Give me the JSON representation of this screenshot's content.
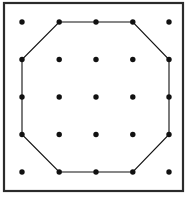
{
  "figure": {
    "name": "geoboard-octagon-figure",
    "canvas": {
      "width": 188,
      "height": 201,
      "background": "#ffffff"
    },
    "frame": {
      "name": "outer-border-rectangle",
      "x": 4,
      "y": 3,
      "width": 179,
      "height": 188,
      "stroke": "#2b2b2b",
      "stroke_width": 2.2,
      "fill": "none"
    },
    "grid": {
      "name": "pin-grid",
      "rows": 5,
      "columns": 5,
      "x_positions": [
        22,
        59.2,
        96,
        132.8,
        169
      ],
      "y_positions": [
        22,
        59.5,
        97,
        134.5,
        172
      ],
      "dot_radius": 2.7,
      "dot_color": "#111111",
      "points": [
        {
          "id": "p-0-0",
          "col": 0,
          "row": 0,
          "x": 22,
          "y": 22
        },
        {
          "id": "p-1-0",
          "col": 1,
          "row": 0,
          "x": 59.2,
          "y": 22
        },
        {
          "id": "p-2-0",
          "col": 2,
          "row": 0,
          "x": 96,
          "y": 22
        },
        {
          "id": "p-3-0",
          "col": 3,
          "row": 0,
          "x": 132.8,
          "y": 22
        },
        {
          "id": "p-4-0",
          "col": 4,
          "row": 0,
          "x": 169,
          "y": 22
        },
        {
          "id": "p-0-1",
          "col": 0,
          "row": 1,
          "x": 22,
          "y": 59.5
        },
        {
          "id": "p-1-1",
          "col": 1,
          "row": 1,
          "x": 59.2,
          "y": 59.5
        },
        {
          "id": "p-2-1",
          "col": 2,
          "row": 1,
          "x": 96,
          "y": 59.5
        },
        {
          "id": "p-3-1",
          "col": 3,
          "row": 1,
          "x": 132.8,
          "y": 59.5
        },
        {
          "id": "p-4-1",
          "col": 4,
          "row": 1,
          "x": 169,
          "y": 59.5
        },
        {
          "id": "p-0-2",
          "col": 0,
          "row": 2,
          "x": 22,
          "y": 97
        },
        {
          "id": "p-1-2",
          "col": 1,
          "row": 2,
          "x": 59.2,
          "y": 97
        },
        {
          "id": "p-2-2",
          "col": 2,
          "row": 2,
          "x": 96,
          "y": 97
        },
        {
          "id": "p-3-2",
          "col": 3,
          "row": 2,
          "x": 132.8,
          "y": 97
        },
        {
          "id": "p-4-2",
          "col": 4,
          "row": 2,
          "x": 169,
          "y": 97
        },
        {
          "id": "p-0-3",
          "col": 0,
          "row": 3,
          "x": 22,
          "y": 134.5
        },
        {
          "id": "p-1-3",
          "col": 1,
          "row": 3,
          "x": 59.2,
          "y": 134.5
        },
        {
          "id": "p-2-3",
          "col": 2,
          "row": 3,
          "x": 96,
          "y": 134.5
        },
        {
          "id": "p-3-3",
          "col": 3,
          "row": 3,
          "x": 132.8,
          "y": 134.5
        },
        {
          "id": "p-4-3",
          "col": 4,
          "row": 3,
          "x": 169,
          "y": 134.5
        },
        {
          "id": "p-0-4",
          "col": 0,
          "row": 4,
          "x": 22,
          "y": 172
        },
        {
          "id": "p-1-4",
          "col": 1,
          "row": 4,
          "x": 59.2,
          "y": 172
        },
        {
          "id": "p-2-4",
          "col": 2,
          "row": 4,
          "x": 96,
          "y": 172
        },
        {
          "id": "p-3-4",
          "col": 3,
          "row": 4,
          "x": 132.8,
          "y": 172
        },
        {
          "id": "p-4-4",
          "col": 4,
          "row": 4,
          "x": 169,
          "y": 172
        }
      ]
    },
    "shape": {
      "name": "octagon-outline",
      "sides": 8,
      "stroke": "#111111",
      "stroke_width": 1.1,
      "fill": "none",
      "closed": true,
      "vertices": [
        {
          "id": "v1",
          "col": 1,
          "row": 0,
          "x": 59.2,
          "y": 22
        },
        {
          "id": "v2",
          "col": 3,
          "row": 0,
          "x": 132.8,
          "y": 22
        },
        {
          "id": "v3",
          "col": 4,
          "row": 1,
          "x": 169,
          "y": 59.5
        },
        {
          "id": "v4",
          "col": 4,
          "row": 3,
          "x": 169,
          "y": 134.5
        },
        {
          "id": "v5",
          "col": 3,
          "row": 4,
          "x": 132.8,
          "y": 172
        },
        {
          "id": "v6",
          "col": 1,
          "row": 4,
          "x": 59.2,
          "y": 172
        },
        {
          "id": "v7",
          "col": 0,
          "row": 3,
          "x": 22,
          "y": 134.5
        },
        {
          "id": "v8",
          "col": 0,
          "row": 1,
          "x": 22,
          "y": 59.5
        }
      ],
      "path": "M 59.2 22 L 132.8 22 L 169 59.5 L 169 134.5 L 132.8 172 L 59.2 172 L 22 134.5 L 22 59.5 Z"
    }
  }
}
